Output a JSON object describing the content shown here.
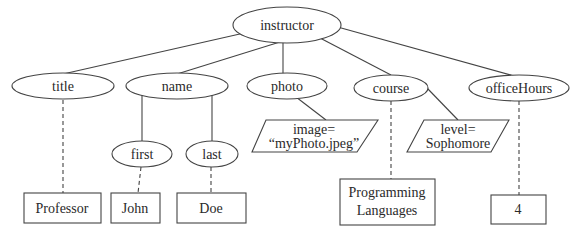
{
  "diagram": {
    "type": "xml-tree",
    "root": {
      "id": "instructor",
      "label": "instructor",
      "shape": "ellipse"
    },
    "elements": [
      {
        "id": "title",
        "label": "title",
        "shape": "ellipse"
      },
      {
        "id": "name",
        "label": "name",
        "shape": "ellipse"
      },
      {
        "id": "photo",
        "label": "photo",
        "shape": "ellipse"
      },
      {
        "id": "course",
        "label": "course",
        "shape": "ellipse"
      },
      {
        "id": "officeHours",
        "label": "officeHours",
        "shape": "ellipse"
      },
      {
        "id": "first",
        "label": "first",
        "shape": "ellipse"
      },
      {
        "id": "last",
        "label": "last",
        "shape": "ellipse"
      }
    ],
    "attributes": [
      {
        "id": "image",
        "line1": "image=",
        "line2": "“myPhoto.jpeg”",
        "shape": "parallelogram"
      },
      {
        "id": "level",
        "line1": "level=",
        "line2": "Sophomore",
        "shape": "parallelogram"
      }
    ],
    "text_nodes": [
      {
        "id": "professor",
        "label": "Professor",
        "shape": "rectangle"
      },
      {
        "id": "john",
        "label": "John",
        "shape": "rectangle"
      },
      {
        "id": "doe",
        "label": "Doe",
        "shape": "rectangle"
      },
      {
        "id": "programming",
        "line1": "Programming",
        "line2": "Languages",
        "shape": "rectangle"
      },
      {
        "id": "four",
        "label": "4",
        "shape": "rectangle"
      }
    ],
    "edges": [
      {
        "from": "instructor",
        "to": "title",
        "style": "solid"
      },
      {
        "from": "instructor",
        "to": "name",
        "style": "solid"
      },
      {
        "from": "instructor",
        "to": "photo",
        "style": "solid"
      },
      {
        "from": "instructor",
        "to": "course",
        "style": "solid"
      },
      {
        "from": "instructor",
        "to": "officeHours",
        "style": "solid"
      },
      {
        "from": "name",
        "to": "first",
        "style": "solid"
      },
      {
        "from": "name",
        "to": "last",
        "style": "solid"
      },
      {
        "from": "photo",
        "to": "image",
        "style": "solid"
      },
      {
        "from": "course",
        "to": "level",
        "style": "solid"
      },
      {
        "from": "title",
        "to": "professor",
        "style": "dashed"
      },
      {
        "from": "first",
        "to": "john",
        "style": "dashed"
      },
      {
        "from": "last",
        "to": "doe",
        "style": "dashed"
      },
      {
        "from": "course",
        "to": "programming",
        "style": "dashed"
      },
      {
        "from": "officeHours",
        "to": "four",
        "style": "dashed"
      }
    ]
  }
}
